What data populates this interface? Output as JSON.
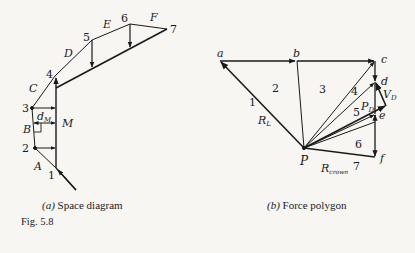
{
  "figure": {
    "number_label": "Fig. 5.8",
    "colors": {
      "ink": "#1a1a1a",
      "background": "#f7f6f3"
    }
  },
  "space_diagram": {
    "caption_letter": "(a)",
    "caption_text": "Space diagram",
    "joint_labels": [
      "1",
      "2",
      "3",
      "4",
      "5",
      "6",
      "7"
    ],
    "region_labels": [
      "A",
      "B",
      "C",
      "D",
      "E",
      "F"
    ],
    "moment_label": "M",
    "lever_arm_label": "d",
    "lever_arm_subscript": "M"
  },
  "force_polygon": {
    "caption_letter": "(b)",
    "caption_text": "Force polygon",
    "point_labels": [
      "a",
      "b",
      "c",
      "d",
      "e",
      "f"
    ],
    "pole_label": "P",
    "ray_labels": [
      "1",
      "2",
      "3",
      "4",
      "5",
      "6",
      "7"
    ],
    "left_reaction_label": "R",
    "left_reaction_subscript": "L",
    "crown_reaction_label": "R",
    "crown_reaction_subscript": "crown",
    "pd_label": "P",
    "pd_subscript": "D",
    "vd_label": "V",
    "vd_subscript": "D"
  }
}
